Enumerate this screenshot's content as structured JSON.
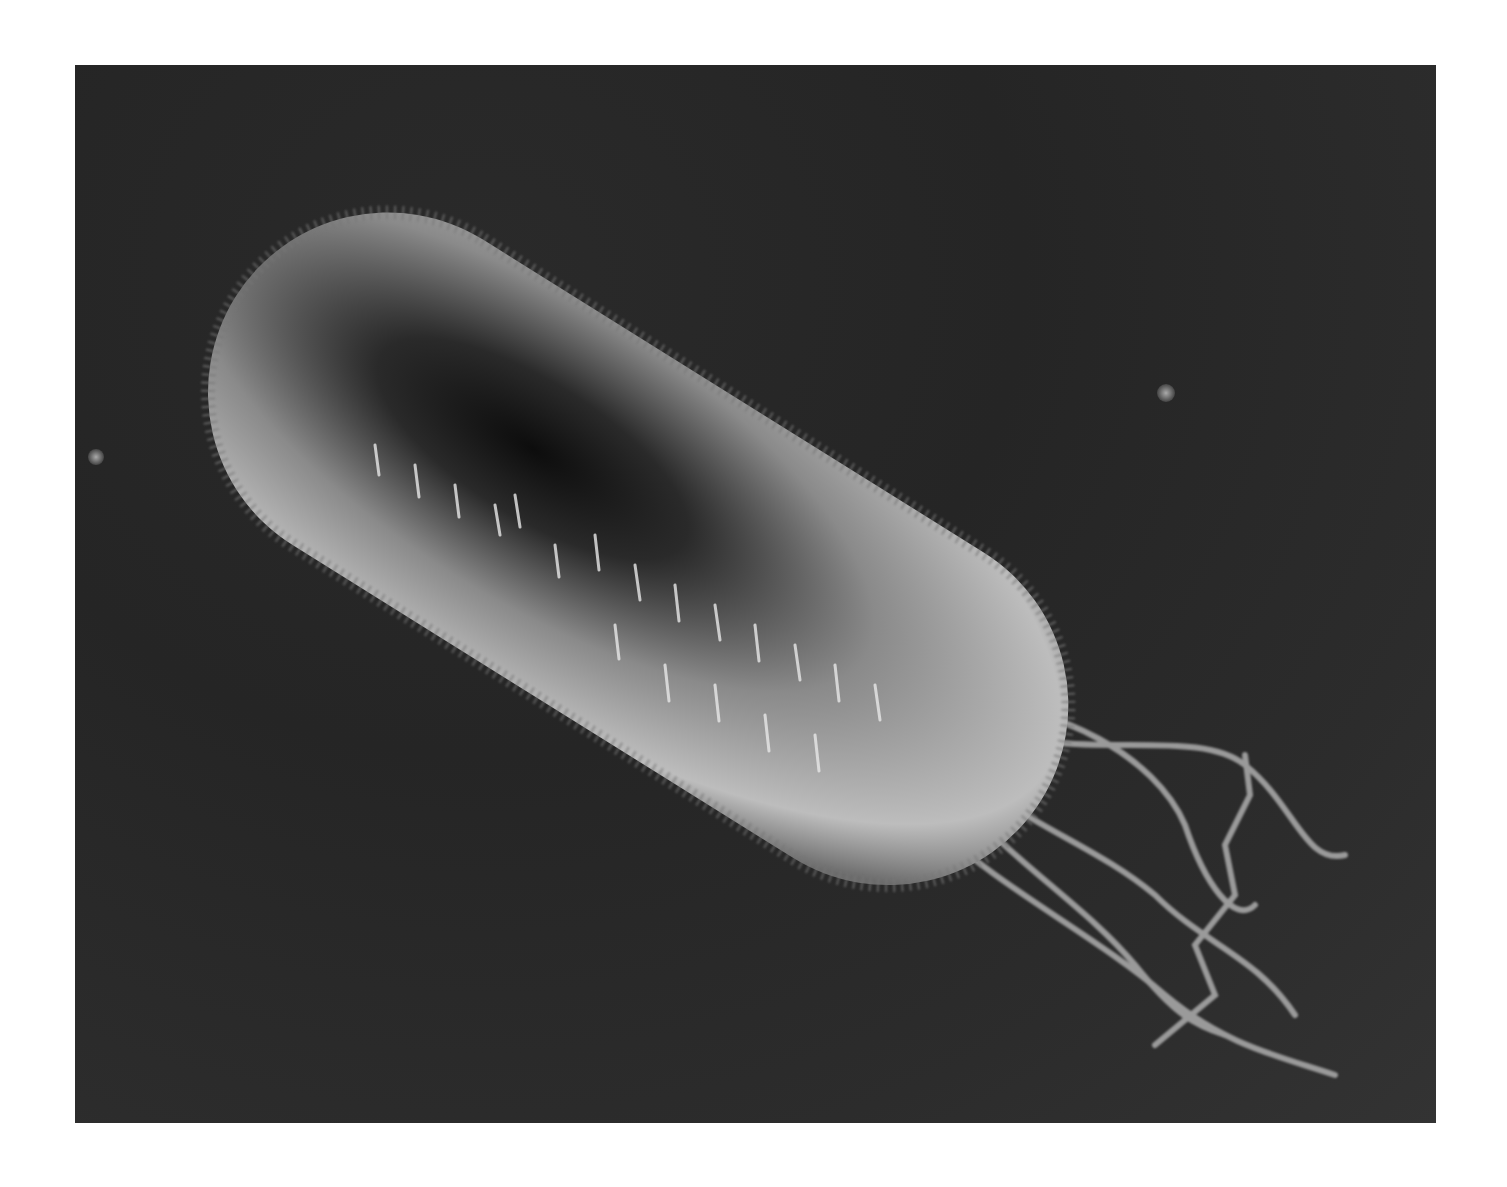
{
  "image": {
    "subject": "bacterium with flagella",
    "description": "Grayscale rendered illustration of a rod-shaped bacterium covered in short hair-like pili, with a bundle of long curly flagella trailing to the lower right, on a dark background",
    "colors": {
      "page_background": "#ffffff",
      "panel_background": "#262626",
      "body_highlight": "#d9d9d9",
      "body_shadow": "#0e0e0e",
      "flagella": "#9a9a9a"
    }
  }
}
